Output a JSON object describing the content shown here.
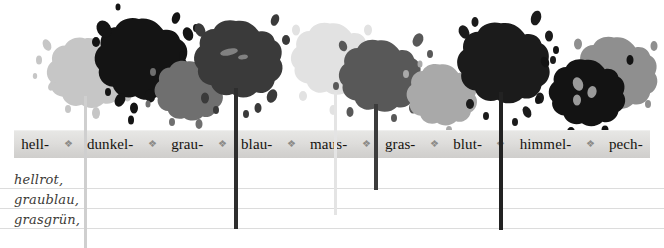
{
  "page": {
    "kind": "german-colour-word-worksheet",
    "width": 664,
    "height": 248
  },
  "label_bar": {
    "separator_glyph": "❖",
    "background_color": "#dedddb",
    "text_color": "#15130f",
    "items": [
      {
        "label": "hell-",
        "splat_color": "#c6c6c6",
        "stem_color": "#cfcfcf",
        "stem_bottom": 248
      },
      {
        "label": "dunkel-",
        "splat_color": "#141414",
        "stem_color": null,
        "stem_bottom": null
      },
      {
        "label": "grau-",
        "splat_color": "#6f6f6f",
        "stem_color": null,
        "stem_bottom": null
      },
      {
        "label": "blau-",
        "splat_color": "#3a3a3a",
        "stem_color": "#2e2e2e",
        "stem_bottom": 229
      },
      {
        "label": "maus-",
        "splat_color": "#e2e2e2",
        "stem_color": "#e4e4e4",
        "stem_bottom": 215
      },
      {
        "label": "gras-",
        "splat_color": "#585858",
        "stem_color": "#3c3c3c",
        "stem_bottom": 190
      },
      {
        "label": "blut-",
        "splat_color": "#a9a9a9",
        "stem_color": null,
        "stem_bottom": null
      },
      {
        "label": "himmel-",
        "splat_color": "#1b1b1b",
        "stem_color": "#222222",
        "stem_bottom": 230
      },
      {
        "label": "pech-",
        "splat_color": "#8f8f8f",
        "stem_color": null,
        "stem_bottom": null
      }
    ]
  },
  "notes": {
    "lines": [
      "hellrot,",
      "graublau,",
      "grasgrün,"
    ],
    "rule_color": "#dcdcdc",
    "text_color": "#3c3a36"
  }
}
